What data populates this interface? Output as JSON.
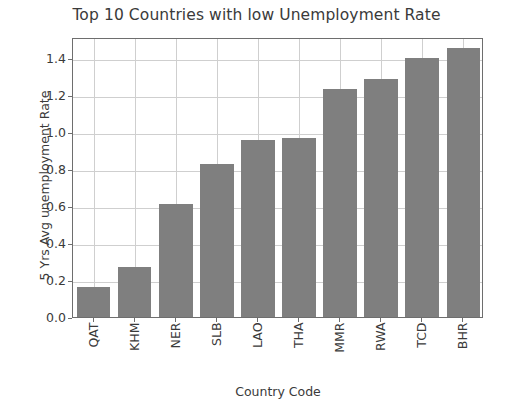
{
  "chart_data": {
    "type": "bar",
    "title": "Top 10 Countries with low Unemployment Rate",
    "xlabel": "Country Code",
    "ylabel": "5 Yrs Avg unemployment Rate",
    "categories": [
      "QAT",
      "KHM",
      "NER",
      "SLB",
      "LAO",
      "THA",
      "MMR",
      "RWA",
      "TCD",
      "BHR"
    ],
    "values": [
      0.16,
      0.27,
      0.61,
      0.83,
      0.96,
      0.97,
      1.235,
      1.29,
      1.4,
      1.455
    ],
    "ylim": [
      0.0,
      1.515
    ],
    "yticks": [
      0.0,
      0.2,
      0.4,
      0.6,
      0.8,
      1.0,
      1.2,
      1.4
    ],
    "ytick_labels": [
      "0.0",
      "0.2",
      "0.4",
      "0.6",
      "0.8",
      "1.0",
      "1.2",
      "1.4"
    ],
    "grid": true,
    "legend": null,
    "bar_color": "#7f7f7f",
    "grid_color": "#cfcfcf",
    "axis_color": "#6e6e6e",
    "background": "#ffffff"
  }
}
